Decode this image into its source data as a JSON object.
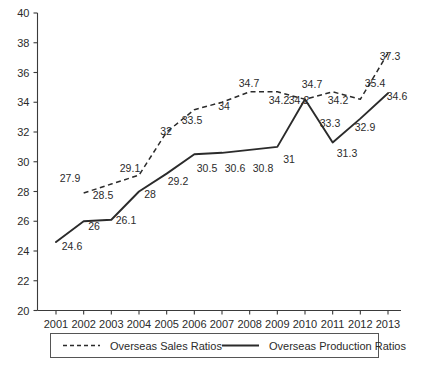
{
  "chart_data": {
    "type": "line",
    "title": "",
    "xlabel": "",
    "ylabel": "",
    "ylim": [
      20,
      40
    ],
    "ytick_step": 2,
    "yticks": [
      20,
      22,
      24,
      26,
      28,
      30,
      32,
      34,
      36,
      38,
      40
    ],
    "grid": false,
    "legend_position": "bottom",
    "categories": [
      "2001",
      "2002",
      "2003",
      "2004",
      "2005",
      "2006",
      "2007",
      "2008",
      "2009",
      "2010",
      "2011",
      "2012",
      "2013"
    ],
    "series": [
      {
        "name": "Overseas Sales Ratios",
        "style": "dashed",
        "values": [
          null,
          27.9,
          28.5,
          29.1,
          32,
          33.5,
          34,
          34.7,
          34.7,
          34.2,
          34.7,
          34.2,
          37.3
        ],
        "labels": [
          "",
          "27.9",
          "28.5",
          "29.1",
          "32",
          "33.5",
          "34",
          "34.7",
          "34.7",
          "34.2",
          "34.7",
          "34.2",
          "37.3"
        ]
      },
      {
        "name": "Overseas Production Ratios",
        "style": "solid",
        "values": [
          24.6,
          26,
          26.1,
          28,
          29.2,
          30.5,
          30.6,
          30.8,
          31,
          34.2,
          31.3,
          32.9,
          34.6
        ],
        "labels": [
          "24.6",
          "26",
          "26.1",
          "28",
          "29.2",
          "30.5",
          "30.6",
          "30.8",
          "31",
          "34.2",
          "31.3",
          "32.9",
          "34.6"
        ]
      }
    ]
  },
  "axis": {
    "y_tick_labels": [
      "40",
      "38",
      "36",
      "34",
      "32",
      "30",
      "28",
      "26",
      "24",
      "22",
      "20"
    ],
    "x_tick_labels": [
      "2001",
      "2002",
      "2003",
      "2004",
      "2005",
      "2006",
      "2007",
      "2008",
      "2009",
      "2010",
      "2011",
      "2012",
      "2013"
    ]
  },
  "legend": {
    "entries": [
      {
        "label": "Overseas Sales Ratios",
        "style": "dashed"
      },
      {
        "label": "Overseas Production Ratios",
        "style": "solid"
      }
    ]
  },
  "colors": {
    "line": "#2b2b2b",
    "axis": "#3a3a3a",
    "text": "#2b2b2b",
    "legend_border": "#555555",
    "background": "#ffffff"
  },
  "data_labels": {
    "sales": [
      {
        "text": "27.9",
        "x": 70,
        "y": 182
      },
      {
        "text": "28.5",
        "x": 103,
        "y": 199
      },
      {
        "text": "29.1",
        "x": 130,
        "y": 172
      },
      {
        "text": "32",
        "x": 166,
        "y": 135
      },
      {
        "text": "33.5",
        "x": 192,
        "y": 124
      },
      {
        "text": "34",
        "x": 224,
        "y": 110
      },
      {
        "text": "34.7",
        "x": 249,
        "y": 87
      },
      {
        "text": "34.2",
        "x": 279,
        "y": 104
      },
      {
        "text": "34.7",
        "x": 312,
        "y": 88
      },
      {
        "text": "34.2",
        "x": 338,
        "y": 104
      },
      {
        "text": "37.3",
        "x": 390,
        "y": 60
      }
    ],
    "production": [
      {
        "text": "24.6",
        "x": 72,
        "y": 250
      },
      {
        "text": "26",
        "x": 94,
        "y": 230
      },
      {
        "text": "26.1",
        "x": 126,
        "y": 224
      },
      {
        "text": "28",
        "x": 150,
        "y": 198
      },
      {
        "text": "29.2",
        "x": 178,
        "y": 185
      },
      {
        "text": "30.5",
        "x": 207,
        "y": 172
      },
      {
        "text": "30.6",
        "x": 235,
        "y": 172
      },
      {
        "text": "30.8",
        "x": 263,
        "y": 172
      },
      {
        "text": "31",
        "x": 289,
        "y": 163
      },
      {
        "text": "34.2",
        "x": 299,
        "y": 104
      },
      {
        "text": "33.3",
        "x": 330,
        "y": 127
      },
      {
        "text": "31.3",
        "x": 347,
        "y": 157
      },
      {
        "text": "32.9",
        "x": 365,
        "y": 131
      },
      {
        "text": "35.4",
        "x": 375,
        "y": 87
      },
      {
        "text": "34.6",
        "x": 397,
        "y": 100
      }
    ]
  }
}
